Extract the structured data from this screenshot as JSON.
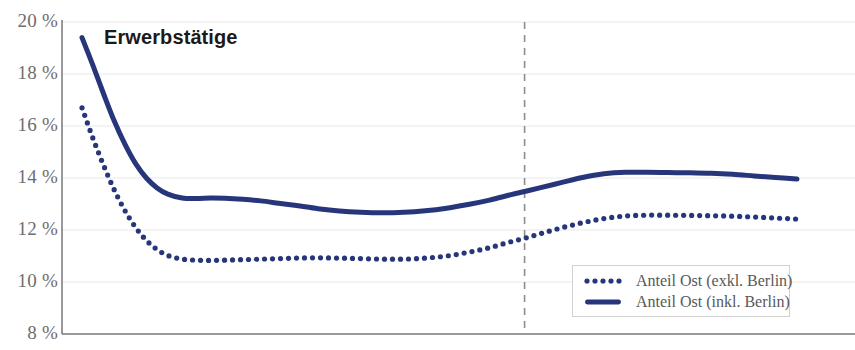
{
  "chart_data": {
    "type": "line",
    "title": "Erwerbstätige",
    "xlabel": "",
    "ylabel": "",
    "ylim": [
      8,
      20
    ],
    "yticks": [
      20,
      18,
      16,
      14,
      12,
      10,
      8
    ],
    "ytick_labels": [
      "20 %",
      "18 %",
      "16 %",
      "14 %",
      "12 %",
      "10 %",
      "8 %"
    ],
    "grid": true,
    "legend_position": "bottom-right",
    "annotations": [
      {
        "type": "vline",
        "x": 0.619,
        "style": "dashed",
        "color": "#8c8c8c"
      }
    ],
    "colors": {
      "series": "#27367a",
      "grid": "#e9e9e9",
      "axis": "#777777",
      "tick_text": "#6d6d6d",
      "legend_text": "#585858",
      "title": "#1a1a1a",
      "vline": "#8c8c8c"
    },
    "x": [
      0.0,
      0.015,
      0.03,
      0.045,
      0.06,
      0.075,
      0.09,
      0.105,
      0.12,
      0.14,
      0.16,
      0.18,
      0.2,
      0.225,
      0.25,
      0.275,
      0.3,
      0.33,
      0.36,
      0.39,
      0.42,
      0.45,
      0.48,
      0.51,
      0.54,
      0.57,
      0.6,
      0.619,
      0.64,
      0.67,
      0.7,
      0.73,
      0.76,
      0.79,
      0.82,
      0.85,
      0.88,
      0.91,
      0.94,
      0.97,
      1.0
    ],
    "series": [
      {
        "name": "Anteil Ost (exkl. Berlin)",
        "style": "dotted",
        "values": [
          16.7,
          15.55,
          14.5,
          13.55,
          12.75,
          12.1,
          11.6,
          11.25,
          11.02,
          10.88,
          10.84,
          10.83,
          10.84,
          10.86,
          10.88,
          10.9,
          10.92,
          10.93,
          10.92,
          10.9,
          10.88,
          10.88,
          10.92,
          11.0,
          11.14,
          11.32,
          11.55,
          11.68,
          11.85,
          12.08,
          12.28,
          12.44,
          12.54,
          12.57,
          12.57,
          12.56,
          12.55,
          12.53,
          12.5,
          12.46,
          12.42
        ]
      },
      {
        "name": "Anteil Ost (inkl. Berlin)",
        "style": "solid",
        "values": [
          19.4,
          18.35,
          17.25,
          16.2,
          15.3,
          14.55,
          14.0,
          13.62,
          13.38,
          13.23,
          13.21,
          13.23,
          13.22,
          13.18,
          13.12,
          13.03,
          12.94,
          12.82,
          12.73,
          12.68,
          12.66,
          12.68,
          12.74,
          12.84,
          12.98,
          13.15,
          13.36,
          13.48,
          13.62,
          13.82,
          14.02,
          14.16,
          14.22,
          14.22,
          14.21,
          14.2,
          14.18,
          14.14,
          14.08,
          14.02,
          13.96
        ]
      }
    ]
  },
  "legend": {
    "items": [
      {
        "label": "Anteil Ost (exkl. Berlin)",
        "style": "dotted"
      },
      {
        "label": "Anteil Ost (inkl. Berlin)",
        "style": "solid"
      }
    ]
  }
}
